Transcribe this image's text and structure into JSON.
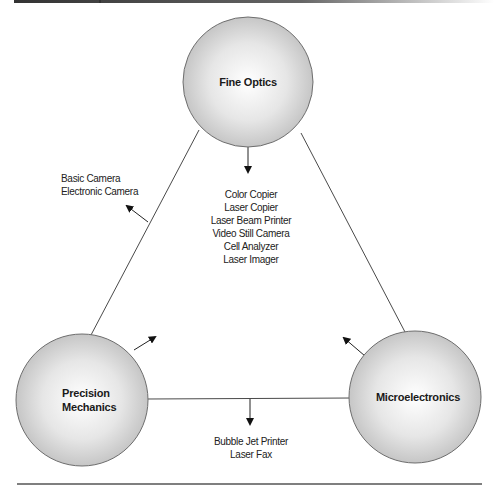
{
  "diagram": {
    "colors": {
      "circle_edge": "#6e6e6e",
      "circle_center": "#ffffff",
      "circle_outer": "#c9c9c9",
      "line": "#4a4a4a",
      "rule": "#555555"
    },
    "nodes": [
      {
        "id": "fine-optics",
        "lines": [
          "Fine Optics"
        ],
        "cx": 248,
        "cy": 82,
        "r": 65
      },
      {
        "id": "precision-mechanics",
        "lines": [
          "Precision",
          "Mechanics"
        ],
        "cx": 82,
        "cy": 400,
        "r": 66
      },
      {
        "id": "microelectronics",
        "lines": [
          "Microelectronics"
        ],
        "cx": 415,
        "cy": 397,
        "r": 66
      }
    ],
    "outputs": {
      "fine_optics": {
        "items": [
          "Color Copier",
          "Laser Copier",
          "Laser Beam Printer",
          "Video Still Camera",
          "Cell Analyzer",
          "Laser Imager"
        ]
      },
      "optics_mechanics": {
        "items": [
          "Basic Camera",
          "Electronic Camera"
        ]
      },
      "mechanics_electronics": {
        "items": [
          "Bubble Jet Printer",
          "Laser Fax"
        ]
      }
    }
  }
}
